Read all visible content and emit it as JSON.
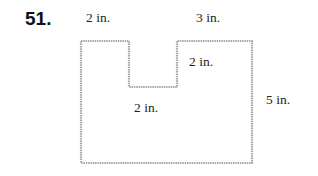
{
  "problem": {
    "number": "51.",
    "labels": {
      "top_left": "2 in.",
      "top_right": "3 in.",
      "notch_depth": "2 in.",
      "notch_width": "2 in.",
      "right_side": "5 in."
    },
    "figure": {
      "type": "rectilinear-polygon",
      "description": "Rectangle with a rectangular notch cut from the top edge",
      "stroke_color": "#a8a8a8"
    }
  }
}
